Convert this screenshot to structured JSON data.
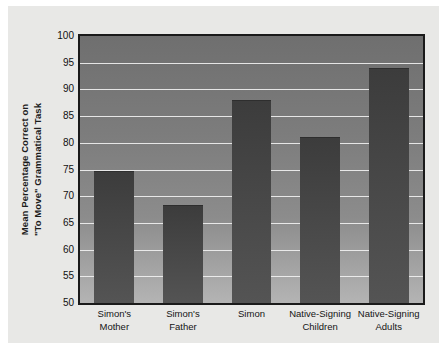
{
  "chart_data": {
    "type": "bar",
    "title": "",
    "xlabel": "",
    "ylabel": "Mean Percentage Correct on\n\"To Move\" Grammatical Task",
    "ylim": [
      50,
      100
    ],
    "ytick_step": 5,
    "yticks": [
      100,
      95,
      90,
      85,
      80,
      75,
      70,
      65,
      60,
      55,
      50
    ],
    "ytick_labels": [
      "100",
      "95",
      "90",
      "85",
      "80",
      "75",
      "70",
      "65",
      "60",
      "55",
      "50"
    ],
    "grid": true,
    "legend": null,
    "categories": [
      "Simon's\nMother",
      "Simon's\nFather",
      "Simon",
      "Native-Signing\nChildren",
      "Native-Signing\nAdults"
    ],
    "values": [
      74.7,
      68.4,
      88.0,
      81.0,
      94.0
    ],
    "bar_color": "#474747",
    "plot_background": "#8c8c8c",
    "gridline_color": "#f2f2f2",
    "axis_color": "#1a1a1a",
    "panel_background": "#e8e8e6"
  },
  "axis": {
    "ylabel_line1": "Mean Percentage Correct on",
    "ylabel_line2": "\"To Move\" Grammatical Task"
  }
}
